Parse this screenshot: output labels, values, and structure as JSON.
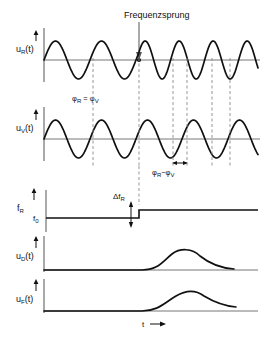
{
  "figure": {
    "title_annotation": "Frequenzsprung",
    "axis_x_label": "t",
    "axis_x_arrow": "→"
  },
  "panels": [
    {
      "id": "u_R",
      "y_label_base": "u",
      "y_label_sub": "R",
      "y_label_tail": "(t)",
      "y_label_full": "uR(t)",
      "description": "reference oscillator voltage with frequency jump"
    },
    {
      "id": "u_V",
      "y_label_base": "u",
      "y_label_sub": "V",
      "y_label_tail": "(t)",
      "y_label_full": "uV(t)",
      "description": "comparison oscillator voltage, constant frequency"
    },
    {
      "id": "f_R",
      "y_label_base": "f",
      "y_label_sub": "R",
      "y_label_tail": "",
      "y_label_full": "fR",
      "level_label_base": "f",
      "level_label_sub": "0",
      "level_label_full": "f₀",
      "step_label_base": "Δf",
      "step_label_sub": "R",
      "step_label_full": "ΔfR",
      "description": "reference frequency step"
    },
    {
      "id": "u_D",
      "y_label_base": "u",
      "y_label_sub": "D",
      "y_label_tail": "(t)",
      "y_label_full": "uD(t)",
      "description": "phase detector output pulse"
    },
    {
      "id": "u_F",
      "y_label_base": "u",
      "y_label_sub": "F",
      "y_label_tail": "(t)",
      "y_label_full": "uF(t)",
      "description": "loop filter output pulse"
    }
  ],
  "annotations": {
    "phase_equal": {
      "left_base": "φ",
      "left_sub": "R",
      "operator": "=",
      "right_base": "φ",
      "right_sub": "V",
      "full": "φR = φV"
    },
    "phase_diff": {
      "left_base": "φ",
      "left_sub": "R",
      "operator": "−",
      "right_base": "φ",
      "right_sub": "V",
      "full": "φR − φV"
    }
  },
  "chart_data": {
    "type": "line",
    "title": "Frequenzsprung",
    "xlabel": "t",
    "ylabel": "",
    "grid": false,
    "legend_position": "none",
    "jump_time_px": 139,
    "series": [
      {
        "name": "u_R(t)",
        "kind": "sine",
        "amplitude": 1,
        "period_before_px": 46,
        "period_after_px": 34,
        "phase_shift": 0,
        "note": "frequency increases after the jump"
      },
      {
        "name": "u_V(t)",
        "kind": "sine",
        "amplitude": 1,
        "period_before_px": 46,
        "period_after_px": 46,
        "phase_shift": 0,
        "note": "frequency constant throughout"
      },
      {
        "name": "f_R",
        "kind": "step",
        "baseline": "f0",
        "step_at_px": 139,
        "step_height": "ΔfR"
      },
      {
        "name": "u_D(t)",
        "kind": "pulse",
        "onset_px": 145,
        "peak_px": 185,
        "peak_value": 1,
        "end_value": 0.15
      },
      {
        "name": "u_F(t)",
        "kind": "pulse",
        "onset_px": 145,
        "peak_px": 192,
        "peak_value": 1,
        "end_value": 0.35
      }
    ],
    "dashed_markers_px": [
      93,
      139,
      173,
      187,
      212,
      230
    ]
  },
  "colors": {
    "ink": "#111111",
    "axis": "#4a4a4a",
    "dashed": "#8a8a8a"
  }
}
